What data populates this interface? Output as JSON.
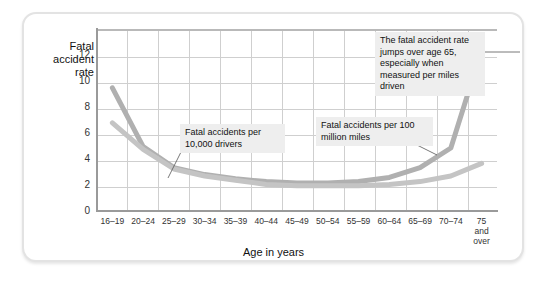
{
  "figure": {
    "y_axis_title": "Fatal\naccident\nrate",
    "x_axis_title": "Age in years"
  },
  "annotations": {
    "jump": "The fatal accident rate jumps over age 65, especially when measured per miles driven",
    "drivers": "Fatal accidents per 10,000 drivers",
    "miles": "Fatal accidents per 100 million miles"
  },
  "colors": {
    "series_drivers": "#bfbfbf",
    "series_miles": "#b0b0b0",
    "grid": "#cfcfcf",
    "axis": "#9a9a9a",
    "note_bg": "#eeeeee",
    "card_border": "#e3e3e3"
  },
  "chart_data": {
    "type": "line",
    "title": "",
    "xlabel": "Age in years",
    "ylabel": "Fatal accident rate",
    "ylim": [
      0,
      13
    ],
    "yticks": [
      0,
      2,
      4,
      6,
      8,
      10,
      12
    ],
    "ytick_labels": [
      "0",
      "2",
      "4",
      "6",
      "8",
      "10",
      "12"
    ],
    "grid": true,
    "legend": "annotated-inline",
    "categories": [
      "16–19",
      "20–24",
      "25–29",
      "30–34",
      "35–39",
      "40–44",
      "45–49",
      "50–54",
      "55–59",
      "60–64",
      "65–69",
      "70–74",
      "75\nand\nover"
    ],
    "series": [
      {
        "name": "Fatal accidents per 100 million miles",
        "values": [
          8.8,
          4.6,
          3.1,
          2.6,
          2.3,
          2.1,
          2.0,
          2.0,
          2.1,
          2.4,
          3.1,
          4.5,
          11.5
        ]
      },
      {
        "name": "Fatal accidents per 10,000 drivers",
        "values": [
          6.3,
          4.4,
          3.0,
          2.5,
          2.2,
          1.9,
          1.8,
          1.8,
          1.8,
          1.9,
          2.1,
          2.5,
          3.4
        ]
      }
    ]
  }
}
